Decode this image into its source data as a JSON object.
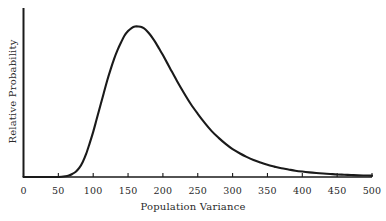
{
  "chart_data": {
    "type": "line",
    "title": "",
    "xlabel": "Population Variance",
    "ylabel": "Relative Probability",
    "xlim": [
      0,
      500
    ],
    "ylim": [
      0,
      1.05
    ],
    "grid": false,
    "legend": false,
    "line_color": "#1a1a1a",
    "background_color": "#ffffff",
    "xticks": [
      {
        "value": 0,
        "label": "0"
      },
      {
        "value": 50,
        "label": "50"
      },
      {
        "value": 100,
        "label": "100"
      },
      {
        "value": 150,
        "label": "150"
      },
      {
        "value": 200,
        "label": "200"
      },
      {
        "value": 250,
        "label": "250"
      },
      {
        "value": 300,
        "label": "300"
      },
      {
        "value": 350,
        "label": "350"
      },
      {
        "value": 400,
        "label": "400"
      },
      {
        "value": 450,
        "label": "450"
      },
      {
        "value": 500,
        "label": "500"
      }
    ],
    "yticks": [],
    "series": [
      {
        "name": "Relative Probability",
        "x": [
          0,
          10,
          20,
          30,
          40,
          50,
          60,
          65,
          70,
          75,
          80,
          85,
          90,
          95,
          100,
          105,
          110,
          115,
          120,
          125,
          130,
          135,
          140,
          145,
          150,
          155,
          160,
          165,
          170,
          175,
          180,
          185,
          190,
          195,
          200,
          210,
          220,
          230,
          240,
          250,
          260,
          270,
          280,
          290,
          300,
          310,
          320,
          330,
          340,
          350,
          360,
          370,
          380,
          390,
          400,
          410,
          420,
          430,
          440,
          450,
          460,
          470,
          480,
          490,
          500
        ],
        "values": [
          0.0,
          0.0,
          0.0,
          0.0,
          0.0,
          0.0,
          0.005,
          0.01,
          0.02,
          0.035,
          0.06,
          0.1,
          0.155,
          0.225,
          0.3,
          0.385,
          0.47,
          0.555,
          0.64,
          0.715,
          0.785,
          0.845,
          0.895,
          0.94,
          0.97,
          0.99,
          1.0,
          1.0,
          0.995,
          0.98,
          0.955,
          0.925,
          0.89,
          0.85,
          0.81,
          0.725,
          0.64,
          0.56,
          0.485,
          0.42,
          0.36,
          0.305,
          0.26,
          0.22,
          0.185,
          0.158,
          0.134,
          0.113,
          0.096,
          0.081,
          0.069,
          0.058,
          0.05,
          0.042,
          0.036,
          0.031,
          0.027,
          0.023,
          0.02,
          0.017,
          0.015,
          0.013,
          0.011,
          0.01,
          0.009
        ]
      }
    ]
  }
}
